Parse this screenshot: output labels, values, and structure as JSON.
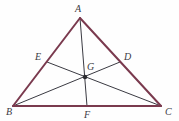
{
  "figure": {
    "background_color": "#fefefe",
    "outline_color": "#7a3a4e",
    "cevian_color": "#3a3a42",
    "label_color": "#3b3b43",
    "point_color": "#2b2b30",
    "outline_width": 2,
    "cevian_width": 1
  },
  "labels": {
    "a": "A",
    "b": "B",
    "c": "C",
    "d": "D",
    "e": "E",
    "f": "F",
    "g": "G"
  },
  "points": {
    "A": {
      "x": 80,
      "y": 18
    },
    "B": {
      "x": 13,
      "y": 106
    },
    "C": {
      "x": 161,
      "y": 106
    },
    "D": {
      "x": 120,
      "y": 62
    },
    "E": {
      "x": 47,
      "y": 62
    },
    "F": {
      "x": 87,
      "y": 106
    },
    "G": {
      "x": 85,
      "y": 77
    }
  },
  "label_positions": {
    "A": {
      "x": 75,
      "y": 4
    },
    "B": {
      "x": 6,
      "y": 107
    },
    "C": {
      "x": 165,
      "y": 107
    },
    "D": {
      "x": 124,
      "y": 52
    },
    "E": {
      "x": 35,
      "y": 52
    },
    "F": {
      "x": 84,
      "y": 110
    },
    "G": {
      "x": 87,
      "y": 62
    }
  },
  "segments": {
    "sides": [
      {
        "name": "side-AB",
        "from": "A",
        "to": "B"
      },
      {
        "name": "side-BC",
        "from": "B",
        "to": "C"
      },
      {
        "name": "side-CA",
        "from": "C",
        "to": "A"
      }
    ],
    "medians": [
      {
        "name": "median-AF",
        "from": "A",
        "to": "F"
      },
      {
        "name": "median-BD",
        "from": "B",
        "to": "D"
      },
      {
        "name": "median-CE",
        "from": "C",
        "to": "E"
      }
    ]
  }
}
